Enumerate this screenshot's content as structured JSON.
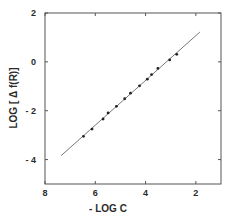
{
  "chart_data": {
    "type": "scatter",
    "title": "",
    "xlabel": "- LOG  C",
    "ylabel": "LOG [ Δ f(R)]",
    "xlim": [
      8,
      1
    ],
    "ylim": [
      -5,
      2
    ],
    "x_reversed": true,
    "grid": false,
    "legend": null,
    "x_ticks": [
      8,
      6,
      4,
      2
    ],
    "x_tick_labels": [
      "8",
      "6",
      "4",
      "2"
    ],
    "y_ticks": [
      2,
      0,
      -2,
      -4
    ],
    "y_tick_labels": [
      "2",
      "0",
      "- 2",
      "- 4"
    ],
    "series": [
      {
        "name": "data",
        "type": "scatter",
        "marker": "filled-circle",
        "x": [
          6.47,
          6.13,
          5.69,
          5.49,
          5.16,
          4.83,
          4.6,
          4.24,
          3.93,
          3.76,
          3.51,
          3.04,
          2.76
        ],
        "y": [
          -3.05,
          -2.75,
          -2.34,
          -2.09,
          -1.82,
          -1.51,
          -1.28,
          -0.98,
          -0.71,
          -0.52,
          -0.27,
          0.08,
          0.31
        ]
      },
      {
        "name": "fit",
        "type": "line",
        "x": [
          7.36,
          1.84
        ],
        "y": [
          -3.84,
          1.22
        ]
      }
    ]
  },
  "colors": {
    "axis": "#555555",
    "line": "#6a6a6a",
    "marker": "#222222",
    "text": "#2a2a2a",
    "background": "#ffffff"
  }
}
